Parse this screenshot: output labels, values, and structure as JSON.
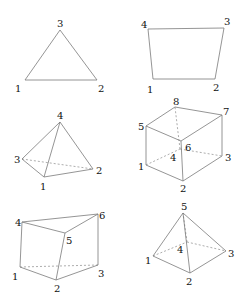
{
  "figures": [
    {
      "name": "triangle",
      "vertices": {
        "1": [
          25,
          80
        ],
        "2": [
          97,
          80
        ],
        "3": [
          60,
          30
        ]
      },
      "labels": [
        {
          "text": "1",
          "pos": [
            15,
            92
          ]
        },
        {
          "text": "2",
          "pos": [
            98,
            92
          ]
        },
        {
          "text": "3",
          "pos": [
            57,
            27
          ]
        }
      ],
      "edges": [
        [
          "1",
          "2"
        ],
        [
          "2",
          "3"
        ],
        [
          "3",
          "1"
        ]
      ],
      "hidden_edges": []
    },
    {
      "name": "quadrilateral",
      "vertices": {
        "1": [
          153,
          79
        ],
        "2": [
          215,
          79
        ],
        "3": [
          224,
          28
        ],
        "4": [
          148,
          29
        ]
      },
      "labels": [
        {
          "text": "1",
          "pos": [
            147,
            93
          ]
        },
        {
          "text": "2",
          "pos": [
            213,
            91
          ]
        },
        {
          "text": "3",
          "pos": [
            224,
            25
          ]
        },
        {
          "text": "4",
          "pos": [
            141,
            28
          ]
        }
      ],
      "edges": [
        [
          "1",
          "2"
        ],
        [
          "2",
          "3"
        ],
        [
          "3",
          "4"
        ],
        [
          "4",
          "1"
        ]
      ],
      "hidden_edges": []
    },
    {
      "name": "tetrahedron",
      "vertices": {
        "1": [
          44,
          177
        ],
        "2": [
          93,
          169
        ],
        "3": [
          22,
          159
        ],
        "4": [
          60,
          122
        ]
      },
      "labels": [
        {
          "text": "1",
          "pos": [
            40,
            190
          ]
        },
        {
          "text": "2",
          "pos": [
            96,
            174
          ]
        },
        {
          "text": "3",
          "pos": [
            14,
            163
          ]
        },
        {
          "text": "4",
          "pos": [
            57,
            119
          ]
        }
      ],
      "edges": [
        [
          "1",
          "2"
        ],
        [
          "2",
          "4"
        ],
        [
          "4",
          "3"
        ],
        [
          "3",
          "1"
        ],
        [
          "1",
          "4"
        ]
      ],
      "hidden_edges": [
        [
          "3",
          "2"
        ]
      ]
    },
    {
      "name": "hexahedron",
      "vertices": {
        "1": [
          146,
          165
        ],
        "2": [
          183,
          181
        ],
        "3": [
          222,
          156
        ],
        "4": [
          180,
          149
        ],
        "5": [
          146,
          126
        ],
        "6": [
          181,
          141
        ],
        "7": [
          222,
          115
        ],
        "8": [
          175,
          107
        ]
      },
      "labels": [
        {
          "text": "1",
          "pos": [
            138,
            170
          ]
        },
        {
          "text": "2",
          "pos": [
            180,
            192
          ]
        },
        {
          "text": "3",
          "pos": [
            225,
            161
          ]
        },
        {
          "text": "4",
          "pos": [
            170,
            161
          ]
        },
        {
          "text": "5",
          "pos": [
            138,
            130
          ]
        },
        {
          "text": "6",
          "pos": [
            185,
            151
          ]
        },
        {
          "text": "7",
          "pos": [
            223,
            115
          ]
        },
        {
          "text": "8",
          "pos": [
            173,
            105
          ]
        }
      ],
      "edges": [
        [
          "1",
          "2"
        ],
        [
          "2",
          "3"
        ],
        [
          "3",
          "7"
        ],
        [
          "7",
          "8"
        ],
        [
          "8",
          "5"
        ],
        [
          "5",
          "1"
        ],
        [
          "5",
          "6"
        ],
        [
          "6",
          "7"
        ],
        [
          "6",
          "2"
        ]
      ],
      "hidden_edges": [
        [
          "1",
          "4"
        ],
        [
          "4",
          "3"
        ],
        [
          "4",
          "8"
        ]
      ]
    },
    {
      "name": "prism",
      "vertices": {
        "1": [
          20,
          267
        ],
        "2": [
          56,
          280
        ],
        "3": [
          98,
          265
        ],
        "4": [
          22,
          222
        ],
        "5": [
          65,
          233
        ],
        "6": [
          98,
          214
        ]
      },
      "labels": [
        {
          "text": "1",
          "pos": [
            12,
            280
          ]
        },
        {
          "text": "2",
          "pos": [
            54,
            292
          ]
        },
        {
          "text": "3",
          "pos": [
            98,
            277
          ]
        },
        {
          "text": "4",
          "pos": [
            15,
            226
          ]
        },
        {
          "text": "5",
          "pos": [
            66,
            244
          ]
        },
        {
          "text": "6",
          "pos": [
            99,
            219
          ]
        }
      ],
      "edges": [
        [
          "1",
          "2"
        ],
        [
          "2",
          "3"
        ],
        [
          "3",
          "6"
        ],
        [
          "6",
          "4"
        ],
        [
          "4",
          "1"
        ],
        [
          "4",
          "5"
        ],
        [
          "5",
          "6"
        ],
        [
          "5",
          "2"
        ]
      ],
      "hidden_edges": [
        [
          "1",
          "3"
        ]
      ]
    },
    {
      "name": "pyramid",
      "vertices": {
        "1": [
          153,
          256
        ],
        "2": [
          190,
          273
        ],
        "3": [
          226,
          251
        ],
        "4": [
          187,
          242
        ],
        "5": [
          183,
          213
        ]
      },
      "labels": [
        {
          "text": "1",
          "pos": [
            145,
            264
          ]
        },
        {
          "text": "2",
          "pos": [
            186,
            285
          ]
        },
        {
          "text": "3",
          "pos": [
            228,
            257
          ]
        },
        {
          "text": "4",
          "pos": [
            177,
            253
          ]
        },
        {
          "text": "5",
          "pos": [
            181,
            210
          ]
        }
      ],
      "edges": [
        [
          "1",
          "2"
        ],
        [
          "2",
          "3"
        ],
        [
          "3",
          "5"
        ],
        [
          "5",
          "1"
        ],
        [
          "5",
          "2"
        ]
      ],
      "hidden_edges": [
        [
          "1",
          "4"
        ],
        [
          "4",
          "3"
        ],
        [
          "4",
          "5"
        ]
      ]
    }
  ]
}
